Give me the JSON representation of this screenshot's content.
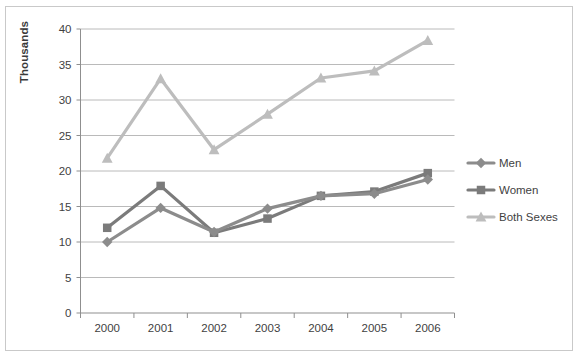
{
  "chart_data": {
    "type": "line",
    "title": "",
    "xlabel": "",
    "ylabel": "Thousands",
    "categories": [
      "2000",
      "2001",
      "2002",
      "2003",
      "2004",
      "2005",
      "2006"
    ],
    "x": [
      2000,
      2001,
      2002,
      2003,
      2004,
      2005,
      2006
    ],
    "ylim": [
      0,
      40
    ],
    "yticks": [
      0,
      5,
      10,
      15,
      20,
      25,
      30,
      35,
      40
    ],
    "ytick_labels": [
      "0",
      "5",
      "10",
      "15",
      "20",
      "25",
      "30",
      "35",
      "40"
    ],
    "grid": true,
    "legend_position": "right",
    "series": [
      {
        "name": "Men",
        "color": "#8c8c8c",
        "marker": "diamond",
        "values": [
          10.0,
          14.8,
          11.4,
          14.7,
          16.5,
          16.8,
          18.8
        ]
      },
      {
        "name": "Women",
        "color": "#7b7b7b",
        "marker": "square",
        "values": [
          12.0,
          17.9,
          11.3,
          13.3,
          16.5,
          17.1,
          19.7
        ]
      },
      {
        "name": "Both Sexes",
        "color": "#bdbdbd",
        "marker": "triangle",
        "values": [
          21.8,
          33.0,
          23.0,
          28.0,
          33.1,
          34.1,
          38.4
        ]
      }
    ]
  },
  "axis": {
    "y_title": "Thousands"
  },
  "legend": {
    "entries": [
      {
        "label": "Men"
      },
      {
        "label": "Women"
      },
      {
        "label": "Both Sexes"
      }
    ]
  },
  "colors": {
    "men": "#8c8c8c",
    "women": "#7b7b7b",
    "both_sexes": "#bdbdbd",
    "gridline": "#a8a8a8",
    "axis": "#8f8f8f",
    "border": "#c9c9c9",
    "text": "#3f3f3f",
    "background": "#ffffff"
  }
}
